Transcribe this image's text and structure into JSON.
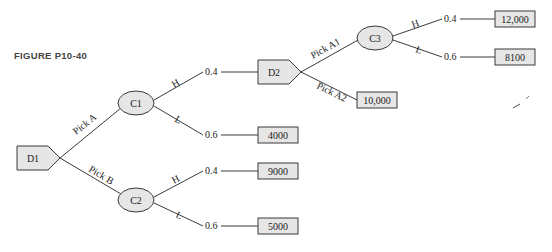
{
  "figure": {
    "caption": "FIGURE P10-40",
    "colors": {
      "node_fill": "#e6e6e6",
      "stroke": "#3a3a3a",
      "text": "#222222"
    }
  },
  "nodes": {
    "d1": {
      "type": "decision",
      "label": "D1"
    },
    "c1": {
      "type": "chance",
      "label": "C1"
    },
    "c2": {
      "type": "chance",
      "label": "C2"
    },
    "d2": {
      "type": "decision",
      "label": "D2"
    },
    "c3": {
      "type": "chance",
      "label": "C3"
    }
  },
  "branches": {
    "d1_a": "Pick A",
    "d1_b": "Pick B",
    "c1_h": "H",
    "c1_l": "L",
    "c2_h": "H",
    "c2_l": "L",
    "d2_a1": "Pick A1",
    "d2_a2": "Pick A2",
    "c3_h": "H",
    "c3_l": "L"
  },
  "probabilities": {
    "c1_h": "0.4",
    "c1_l": "0.6",
    "c2_h": "0.4",
    "c2_l": "0.6",
    "c3_h": "0.4",
    "c3_l": "0.6"
  },
  "outcomes": {
    "c1_l": "4000",
    "c2_h": "9000",
    "c2_l": "5000",
    "d2_a2": "10,000",
    "c3_h": "12,000",
    "c3_l": "8100"
  }
}
